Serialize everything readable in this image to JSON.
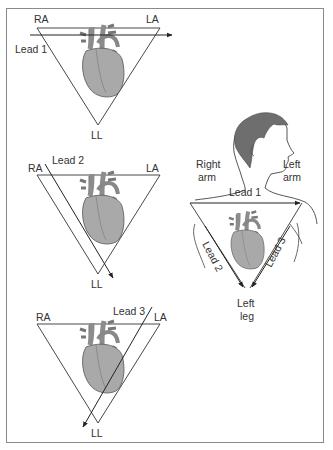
{
  "diagram": {
    "panels": [
      {
        "id": "lead1-panel",
        "corners": {
          "top_left": "RA",
          "top_right": "LA",
          "bottom": "LL"
        },
        "lead_label": "Lead 1",
        "lead_direction": "RA to LA (horizontal, left to right)"
      },
      {
        "id": "lead2-panel",
        "corners": {
          "top_left": "RA",
          "top_right": "LA",
          "bottom": "LL"
        },
        "lead_label": "Lead 2",
        "lead_direction": "RA to LL (downward right)"
      },
      {
        "id": "lead3-panel",
        "corners": {
          "top_left": "RA",
          "top_right": "LA",
          "bottom": "LL"
        },
        "lead_label": "Lead 3",
        "lead_direction": "LA to LL (downward left)"
      }
    ],
    "body_figure": {
      "right_arm": [
        "Right",
        "arm"
      ],
      "left_arm": [
        "Left",
        "arm"
      ],
      "left_leg": [
        "Left",
        "leg"
      ],
      "lead1": "Lead 1",
      "lead2": "Lead 2",
      "lead3": "Lead 3"
    },
    "colors": {
      "line": "#333333",
      "heart_fill": "#a9a9a9",
      "heart_vessels": "#8c8c8c",
      "hair": "#6e6e6e",
      "border": "#8a8a8a"
    }
  }
}
